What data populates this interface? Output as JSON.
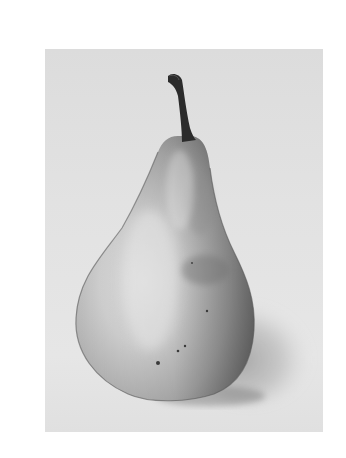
{
  "image": {
    "subject": "Pencil drawing of a pear",
    "medium": "graphite on paper",
    "elements": [
      "paper",
      "pear",
      "stem",
      "cast-shadow",
      "speckles"
    ],
    "colors": {
      "background": "#ffffff",
      "paper": "#e2e2e2",
      "pear_light": "#d8d8d8",
      "pear_mid": "#a8a8a8",
      "pear_dark": "#6e6e6e",
      "stem": "#2a2a2a",
      "shadow": "#b0b0b0"
    }
  }
}
